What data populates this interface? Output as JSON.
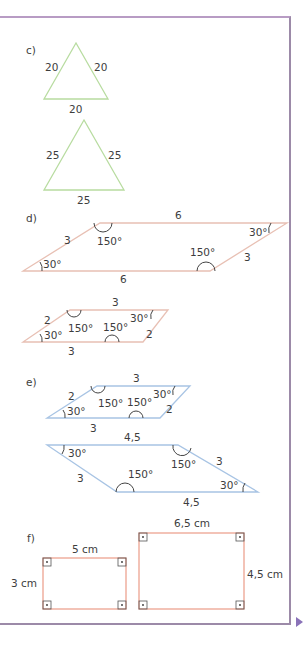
{
  "section_c": {
    "label": "c)",
    "triangle1": {
      "left": "20",
      "right": "20",
      "bottom": "20"
    },
    "triangle2": {
      "left": "25",
      "right": "25",
      "bottom": "25"
    }
  },
  "section_d": {
    "label": "d)",
    "large": {
      "top": "6",
      "bottom": "6",
      "left": "3",
      "right": "3",
      "angle_bl": "30°",
      "angle_tl": "150°",
      "angle_br": "150°",
      "angle_tr": "30°"
    },
    "small": {
      "top": "3",
      "bottom": "3",
      "left": "2",
      "right": "2",
      "angle_bl": "30°",
      "angle_tl": "150°",
      "angle_br": "150°",
      "angle_tr": "30°"
    }
  },
  "section_e": {
    "label": "e)",
    "small": {
      "top": "3",
      "bottom": "3",
      "left": "2",
      "right": "2",
      "angle_bl": "30°",
      "angle_tl": "150°",
      "angle_br": "150°",
      "angle_tr": "30°"
    },
    "large": {
      "top": "4,5",
      "bottom": "4,5",
      "left": "3",
      "right": "3",
      "angle_tl": "30°",
      "angle_tr": "150°",
      "angle_bl": "150°",
      "angle_br": "30°"
    }
  },
  "section_f": {
    "label": "f)",
    "rect1": {
      "width": "5 cm",
      "height": "3 cm"
    },
    "rect2": {
      "width": "6,5 cm",
      "height": "4,5 cm"
    }
  },
  "colors": {
    "frame": "#b89cc4",
    "green": "#b8dca0",
    "salmon": "#e8b4a4",
    "blue": "#a8c4e4",
    "rect": "#ec9c88",
    "arrow": "#8a72b8"
  }
}
